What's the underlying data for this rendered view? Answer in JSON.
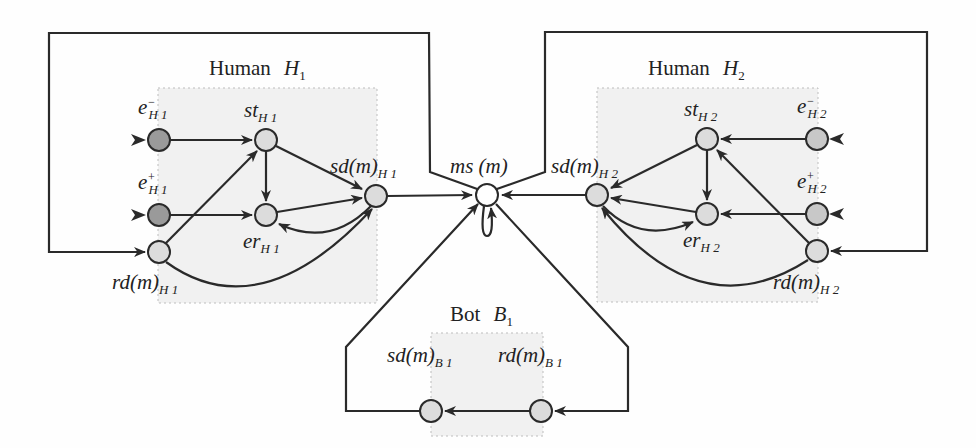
{
  "colors": {
    "line": "#2a2a2a",
    "node_fill": "#dcdcdc",
    "node_dark_fill": "#9a9a9a",
    "ms_fill": "#ffffff",
    "region_fill": "#f1f1f1",
    "region_border": "#bdbdbd"
  },
  "groups": {
    "h1": {
      "title_word": "Human",
      "title_sym": "H",
      "title_sub": "1"
    },
    "h2": {
      "title_word": "Human",
      "title_sym": "H",
      "title_sub": "2"
    },
    "b1": {
      "title_word": "Bot",
      "title_sym": "B",
      "title_sub": "1"
    }
  },
  "nodes": {
    "h1_e_minus": {
      "base": "e",
      "sup": "−",
      "sub": "H 1"
    },
    "h1_e_plus": {
      "base": "e",
      "sup": "+",
      "sub": "H 1"
    },
    "h1_st": {
      "base": "st",
      "sub": "H 1"
    },
    "h1_er": {
      "base": "er",
      "sub": "H 1"
    },
    "h1_sd": {
      "base": "sd(m)",
      "sub": "H 1"
    },
    "h1_rd": {
      "base": "rd(m)",
      "sub": "H 1"
    },
    "ms": {
      "base": "ms (m)"
    },
    "h2_e_minus": {
      "base": "e",
      "sup": "−",
      "sub": "H 2"
    },
    "h2_e_plus": {
      "base": "e",
      "sup": "+",
      "sub": "H 2"
    },
    "h2_st": {
      "base": "st",
      "sub": "H 2"
    },
    "h2_er": {
      "base": "er",
      "sub": "H 2"
    },
    "h2_sd": {
      "base": "sd(m)",
      "sub": "H 2"
    },
    "h2_rd": {
      "base": "rd(m)",
      "sub": "H 2"
    },
    "b1_sd": {
      "base": "sd(m)",
      "sub": "B 1"
    },
    "b1_rd": {
      "base": "rd(m)",
      "sub": "B 1"
    }
  },
  "edges": [
    [
      "h1_e_minus",
      "h1_st"
    ],
    [
      "h1_e_plus",
      "h1_er"
    ],
    [
      "h1_rd",
      "h1_st"
    ],
    [
      "h1_st",
      "h1_er"
    ],
    [
      "h1_st",
      "h1_sd"
    ],
    [
      "h1_er",
      "h1_sd"
    ],
    [
      "h1_sd",
      "h1_er"
    ],
    [
      "h1_rd",
      "h1_sd"
    ],
    [
      "h1_sd",
      "ms"
    ],
    [
      "h2_e_minus",
      "h2_st"
    ],
    [
      "h2_e_plus",
      "h2_er"
    ],
    [
      "h2_rd",
      "h2_st"
    ],
    [
      "h2_st",
      "h2_er"
    ],
    [
      "h2_st",
      "h2_sd"
    ],
    [
      "h2_er",
      "h2_sd"
    ],
    [
      "h2_sd",
      "h2_er"
    ],
    [
      "h2_rd",
      "h2_sd"
    ],
    [
      "h2_sd",
      "ms"
    ],
    [
      "ms",
      "ms"
    ],
    [
      "ms",
      "h1_rd"
    ],
    [
      "ms",
      "h2_rd"
    ],
    [
      "ms",
      "b1_rd"
    ],
    [
      "b1_rd",
      "b1_sd"
    ],
    [
      "b1_sd",
      "ms"
    ]
  ]
}
